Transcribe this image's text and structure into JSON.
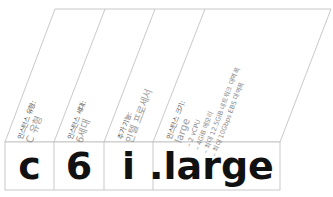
{
  "instance_name": {
    "cells": [
      "c",
      "6",
      "i",
      ".large"
    ]
  },
  "labels": [
    {
      "title": "인스턴스 유형:",
      "value": "C 유형"
    },
    {
      "title": "인스턴스 세대:",
      "value": "6세대"
    },
    {
      "title": "추가 기능:",
      "value": "인텔 프로세서"
    },
    {
      "title": "인스턴스 크기:",
      "value": "large",
      "details": [
        "– 2 vCPU",
        "– 4GiB 메모리",
        "– 최대 12.5GiB 네트워크 대역폭",
        "– 최대 10Gbps EBS 대역폭"
      ]
    }
  ],
  "colors": {
    "line": "#bbbbbb",
    "title_text": "#555555",
    "value_text": "#999999",
    "cell_text": "#111111"
  }
}
